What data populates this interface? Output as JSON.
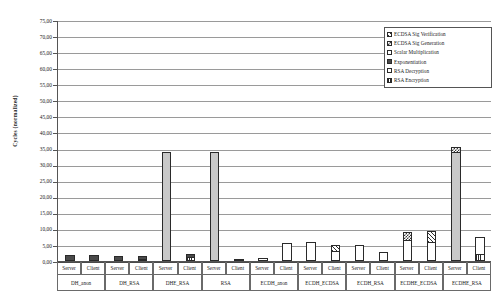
{
  "chart_data": {
    "type": "bar",
    "subtype": "stacked",
    "title": "",
    "xlabel": "",
    "ylabel": "Cycles (normalized)",
    "ylim": [
      0,
      75
    ],
    "ytick_step": 5,
    "ytick_labels": [
      "0,00",
      "5,00",
      "10,00",
      "15,00",
      "20,00",
      "25,00",
      "30,00",
      "35,00",
      "40,00",
      "45,00",
      "50,00",
      "55,00",
      "60,00",
      "65,00",
      "70,00",
      "75,00"
    ],
    "grid": true,
    "legend_position": "top-right",
    "legend": [
      {
        "name": "ECDSA Sig Verification",
        "pattern": "diagonal-hatch"
      },
      {
        "name": "ECDSA Sig Generation",
        "pattern": "checkerboard"
      },
      {
        "name": "Scalar Multiplication",
        "pattern": "blank-white"
      },
      {
        "name": "Exponentiation",
        "pattern": "solid-dark"
      },
      {
        "name": "RSA Decryption",
        "pattern": "light-speckle"
      },
      {
        "name": "RSA Encryption",
        "pattern": "vertical-stripes"
      }
    ],
    "groups": [
      "DH_anon",
      "DH_RSA",
      "DHE_RSA",
      "RSA",
      "ECDH_anon",
      "ECDH_ECDSA",
      "ECDH_RSA",
      "ECDHE_ECDSA",
      "ECDHE_RSA"
    ],
    "roles": [
      "Server",
      "Client"
    ],
    "categories": [
      "DH_anon Server",
      "DH_anon Client",
      "DH_RSA Server",
      "DH_RSA Client",
      "DHE_RSA Server",
      "DHE_RSA Client",
      "RSA Server",
      "RSA Client",
      "ECDH_anon Server",
      "ECDH_anon Client",
      "ECDH_ECDSA Server",
      "ECDH_ECDSA Client",
      "ECDH_RSA Server",
      "ECDH_RSA Client",
      "ECDHE_ECDSA Server",
      "ECDHE_ECDSA Client",
      "ECDHE_RSA Server",
      "ECDHE_RSA Client"
    ],
    "series": [
      {
        "name": "RSA Encryption",
        "values": [
          0,
          0,
          0,
          0.6,
          0,
          1.1,
          0,
          0.6,
          0,
          0,
          0,
          0,
          0,
          0,
          0,
          0,
          0,
          2.2
        ]
      },
      {
        "name": "RSA Decryption",
        "values": [
          0,
          0,
          0,
          0,
          0,
          0,
          33.9,
          0,
          0,
          0,
          0,
          0,
          0,
          0,
          0,
          0,
          0,
          0
        ]
      },
      {
        "name": "Exponentiation",
        "values": [
          1.8,
          1.8,
          1.5,
          1.4,
          34.0,
          1.3,
          0,
          0,
          0,
          0,
          0,
          0,
          0,
          0,
          0,
          0,
          0,
          0
        ]
      },
      {
        "name": "Scalar Multiplication",
        "values": [
          0,
          0,
          0,
          0,
          0,
          0,
          0,
          0,
          1.0,
          5.6,
          6.0,
          3.1,
          5.0,
          2.9,
          6.4,
          5.9,
          33.9,
          5.5
        ]
      },
      {
        "name": "ECDSA Sig Generation",
        "values": [
          0,
          0,
          0,
          0,
          0,
          0,
          0,
          0,
          0,
          0,
          0,
          0,
          0,
          0,
          2.8,
          0,
          1.9,
          0
        ]
      },
      {
        "name": "ECDSA Sig Verification",
        "values": [
          0,
          0,
          0,
          0,
          0,
          0,
          0,
          0,
          0,
          0,
          0,
          2.2,
          0,
          0,
          0,
          3.6,
          0,
          0
        ]
      }
    ],
    "bar_totals": [
      1.8,
      1.8,
      1.5,
      2.0,
      34.0,
      2.4,
      33.9,
      0.6,
      1.0,
      5.6,
      6.0,
      5.3,
      5.0,
      2.9,
      9.2,
      9.5,
      35.8,
      7.7
    ]
  },
  "axes": {
    "y_title": "Cycles (normalized)"
  }
}
